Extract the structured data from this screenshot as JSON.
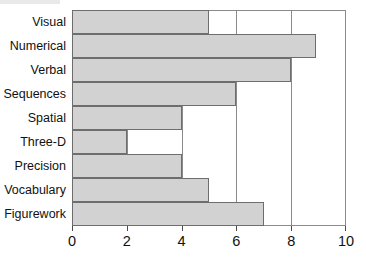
{
  "chart_data": {
    "type": "bar",
    "orientation": "horizontal",
    "title": "",
    "subtitle": "",
    "xlabel": "",
    "ylabel": "",
    "xlim": [
      0,
      10
    ],
    "xticks": [
      0,
      2,
      4,
      6,
      8,
      10
    ],
    "xtick_labels": [
      "0",
      "2",
      "4",
      "6",
      "8",
      "10"
    ],
    "grid": true,
    "grid_axis": "x",
    "legend": false,
    "legend_position": "none",
    "bar_fill_color": "#d2d2d2",
    "bar_edge_color": "#6e6e6e",
    "axis_color": "#8a8a8a",
    "background_color": "#ffffff",
    "categories": [
      "Visual",
      "Numerical",
      "Verbal",
      "Sequences",
      "Spatial",
      "Three-D",
      "Precision",
      "Vocabulary",
      "Figurework"
    ],
    "values": [
      5,
      8.9,
      8,
      6,
      4,
      2,
      4,
      5,
      7
    ],
    "series": [
      {
        "name": "Score",
        "values": [
          5,
          8.9,
          8,
          6,
          4,
          2,
          4,
          5,
          7
        ]
      }
    ]
  }
}
